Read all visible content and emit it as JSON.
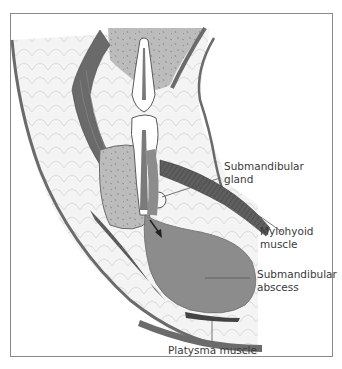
{
  "figure": {
    "labels": [
      {
        "id": "submandibular-gland",
        "text": "Submandibular\ngland"
      },
      {
        "id": "mylohyoid-muscle",
        "text": "Mylohyoid\nmuscle"
      },
      {
        "id": "submandibular-abscess",
        "text": "Submandibular\nabscess"
      },
      {
        "id": "platysma-muscle",
        "text": "Platysma muscle"
      }
    ],
    "colors": {
      "abscess": "#8c8c8c",
      "muscle": "#6e6e6e",
      "bone": "#bdbdbd",
      "soft_tissue": "#f3f3f3",
      "tooth": "#ffffff",
      "outline": "#5a5a5a",
      "border": "#8a8a8a"
    }
  }
}
